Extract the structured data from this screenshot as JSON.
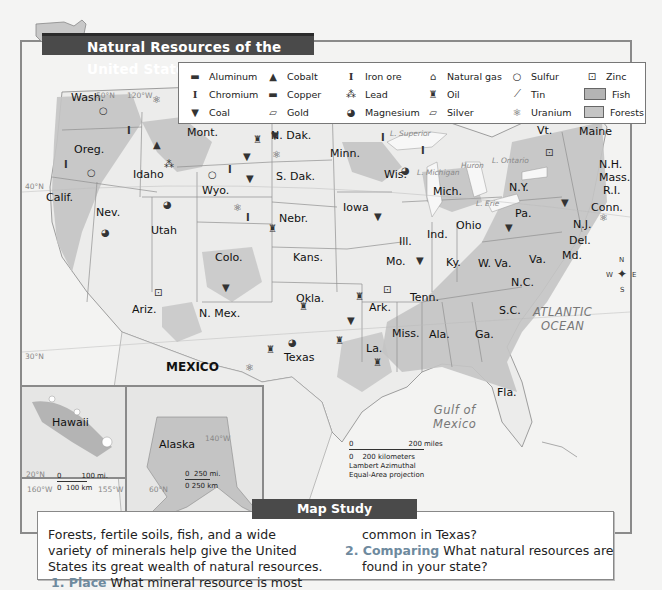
{
  "title": "Natural Resources of the United States",
  "legend": {
    "items": [
      {
        "icon": "aluminum-icon",
        "glyph": "▬",
        "label": "Aluminum"
      },
      {
        "icon": "cobalt-icon",
        "glyph": "▲",
        "label": "Cobalt"
      },
      {
        "icon": "iron-ore-icon",
        "glyph": "I",
        "label": "Iron ore"
      },
      {
        "icon": "natural-gas-icon",
        "glyph": "💧",
        "label": "Natural gas"
      },
      {
        "icon": "sulfur-icon",
        "glyph": "○",
        "label": "Sulfur"
      },
      {
        "icon": "zinc-icon",
        "glyph": "⊡",
        "label": "Zinc"
      },
      {
        "icon": "chromium-icon",
        "glyph": "I",
        "label": "Chromium"
      },
      {
        "icon": "copper-icon",
        "glyph": "▬",
        "label": "Copper"
      },
      {
        "icon": "lead-icon",
        "glyph": "⁂",
        "label": "Lead"
      },
      {
        "icon": "oil-icon",
        "glyph": "♜",
        "label": "Oil"
      },
      {
        "icon": "tin-icon",
        "glyph": "⟋",
        "label": "Tin"
      },
      {
        "icon": "fish-swatch",
        "glyph": "",
        "label": "Fish",
        "swatch": "#b4b4b4"
      },
      {
        "icon": "coal-icon",
        "glyph": "▼",
        "label": "Coal"
      },
      {
        "icon": "gold-icon",
        "glyph": "▱",
        "label": "Gold"
      },
      {
        "icon": "magnesium-icon",
        "glyph": "◕",
        "label": "Magnesium"
      },
      {
        "icon": "silver-icon",
        "glyph": "▱",
        "label": "Silver"
      },
      {
        "icon": "uranium-icon",
        "glyph": "⚛",
        "label": "Uranium"
      },
      {
        "icon": "forests-swatch",
        "glyph": "",
        "label": "Forests",
        "swatch": "#c4c4c4"
      }
    ]
  },
  "states": [
    {
      "name": "Wash.",
      "x": 85,
      "y": 98
    },
    {
      "name": "Oreg.",
      "x": 88,
      "y": 150
    },
    {
      "name": "Idaho",
      "x": 147,
      "y": 175
    },
    {
      "name": "Mont.",
      "x": 201,
      "y": 133
    },
    {
      "name": "N. Dak.",
      "x": 285,
      "y": 136
    },
    {
      "name": "S. Dak.",
      "x": 290,
      "y": 177
    },
    {
      "name": "Wyo.",
      "x": 216,
      "y": 191
    },
    {
      "name": "Calif.",
      "x": 60,
      "y": 198
    },
    {
      "name": "Nev.",
      "x": 110,
      "y": 213
    },
    {
      "name": "Utah",
      "x": 165,
      "y": 231
    },
    {
      "name": "Colo.",
      "x": 229,
      "y": 258
    },
    {
      "name": "Nebr.",
      "x": 293,
      "y": 219
    },
    {
      "name": "Kans.",
      "x": 307,
      "y": 258
    },
    {
      "name": "Minn.",
      "x": 344,
      "y": 154
    },
    {
      "name": "Iowa",
      "x": 357,
      "y": 208
    },
    {
      "name": "Wis.",
      "x": 398,
      "y": 175
    },
    {
      "name": "Mich.",
      "x": 447,
      "y": 192
    },
    {
      "name": "Ill.",
      "x": 413,
      "y": 242
    },
    {
      "name": "Ind.",
      "x": 441,
      "y": 235
    },
    {
      "name": "Ohio",
      "x": 470,
      "y": 226
    },
    {
      "name": "Mo.",
      "x": 400,
      "y": 262
    },
    {
      "name": "Ky.",
      "x": 460,
      "y": 263
    },
    {
      "name": "Tenn.",
      "x": 424,
      "y": 298
    },
    {
      "name": "Okla.",
      "x": 310,
      "y": 299
    },
    {
      "name": "Ark.",
      "x": 383,
      "y": 308
    },
    {
      "name": "Ariz.",
      "x": 146,
      "y": 310
    },
    {
      "name": "N. Mex.",
      "x": 213,
      "y": 314
    },
    {
      "name": "Texas",
      "x": 298,
      "y": 358
    },
    {
      "name": "La.",
      "x": 380,
      "y": 349
    },
    {
      "name": "Miss.",
      "x": 406,
      "y": 334
    },
    {
      "name": "Ala.",
      "x": 443,
      "y": 335
    },
    {
      "name": "Ga.",
      "x": 489,
      "y": 335
    },
    {
      "name": "S.C.",
      "x": 513,
      "y": 311
    },
    {
      "name": "N.C.",
      "x": 525,
      "y": 283
    },
    {
      "name": "Va.",
      "x": 543,
      "y": 260
    },
    {
      "name": "W. Va.",
      "x": 492,
      "y": 264
    },
    {
      "name": "Pa.",
      "x": 529,
      "y": 214
    },
    {
      "name": "N.Y.",
      "x": 523,
      "y": 188
    },
    {
      "name": "Vt.",
      "x": 551,
      "y": 131
    },
    {
      "name": "Maine",
      "x": 593,
      "y": 132
    },
    {
      "name": "N.H.",
      "x": 613,
      "y": 165
    },
    {
      "name": "Mass.",
      "x": 613,
      "y": 178
    },
    {
      "name": "R.I.",
      "x": 617,
      "y": 191
    },
    {
      "name": "Conn.",
      "x": 605,
      "y": 208
    },
    {
      "name": "N.J.",
      "x": 587,
      "y": 225
    },
    {
      "name": "Del.",
      "x": 583,
      "y": 241
    },
    {
      "name": "Md.",
      "x": 576,
      "y": 256
    },
    {
      "name": "Fla.",
      "x": 511,
      "y": 393
    },
    {
      "name": "Hawaii",
      "x": 66,
      "y": 423
    },
    {
      "name": "Alaska",
      "x": 173,
      "y": 445
    }
  ],
  "countries": [
    {
      "name": "MEXICO",
      "x": 166,
      "y": 368
    }
  ],
  "oceans": [
    {
      "name": "ATLANTIC\nOCEAN",
      "x": 543,
      "y": 315
    },
    {
      "name": "Gulf of\nMexico",
      "x": 443,
      "y": 413
    }
  ],
  "lakes": [
    {
      "name": "L. Superior",
      "x": 405,
      "y": 133
    },
    {
      "name": "L. Michigan",
      "x": 432,
      "y": 172
    },
    {
      "name": "Huron",
      "x": 476,
      "y": 165
    },
    {
      "name": "L. Ontario",
      "x": 507,
      "y": 160
    },
    {
      "name": "L. Erie",
      "x": 491,
      "y": 203
    }
  ],
  "coordinates": [
    {
      "text": "50°N",
      "x": 96,
      "y": 95
    },
    {
      "text": "120°W",
      "x": 127,
      "y": 95
    },
    {
      "text": "40°N",
      "x": 25,
      "y": 186
    },
    {
      "text": "30°N",
      "x": 25,
      "y": 356
    },
    {
      "text": "140°W",
      "x": 205,
      "y": 438
    },
    {
      "text": "20°N",
      "x": 26,
      "y": 474
    },
    {
      "text": "160°W",
      "x": 27,
      "y": 489
    },
    {
      "text": "155°W",
      "x": 98,
      "y": 489
    },
    {
      "text": "60°N",
      "x": 149,
      "y": 489
    }
  ],
  "scales": {
    "main": {
      "miles": "200 miles",
      "km": "200 kilometers",
      "zero": "0",
      "projection_1": "Lambert Azimuthal",
      "projection_2": "Equal-Area projection"
    },
    "hawaii": {
      "miles": "100 mi.",
      "km": "100 km",
      "zero": "0"
    },
    "alaska": {
      "miles": "250 mi.",
      "km": "250 km",
      "zero": "0"
    }
  },
  "compass": {
    "n": "N",
    "s": "S",
    "e": "E",
    "w": "W"
  },
  "map_study": {
    "title": "Map Study",
    "intro_1": "Forests, fertile soils, fish, and a wide",
    "intro_2": "variety of minerals help give the United",
    "intro_3": "States its great wealth of natural resources.",
    "q1_num": "1. Place",
    "q1_text_a": " What mineral resource is most",
    "q1_text_b": "common in Texas?",
    "q2_num": "2. Comparing",
    "q2_text_a": " What natural resources are",
    "q2_text_b": "found in your state?"
  },
  "colors": {
    "title_bar": "#4a4a4a",
    "question_accent": "#6e8a9e",
    "fish": "#b4b4b4",
    "forests": "#c4c4c4",
    "land": "#ececeb",
    "water": "#f7f7f7"
  }
}
